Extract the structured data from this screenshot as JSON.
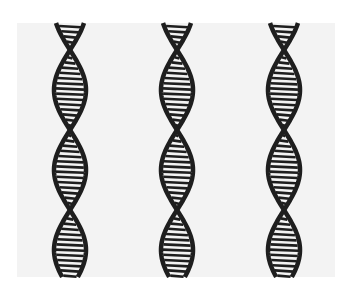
{
  "image": {
    "description": "Hand-drawn illustration of three vertical DNA double helices",
    "background": "#f3f3f3",
    "ink_color": "#1e1e1e",
    "helices": [
      {
        "center_x": 70
      },
      {
        "center_x": 177
      },
      {
        "center_x": 284
      }
    ],
    "crossings_y": [
      50,
      130,
      208
    ],
    "helix_half_width": 16
  }
}
